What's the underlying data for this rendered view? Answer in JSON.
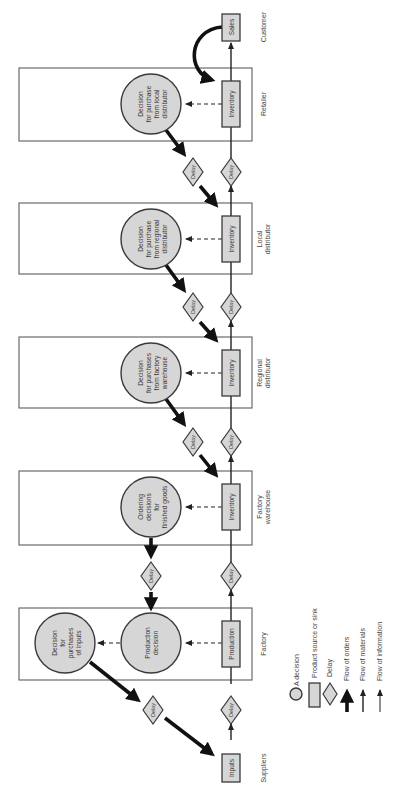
{
  "diagram": {
    "orientation": "rotated 90 degrees counter-clockwise",
    "stages": [
      {
        "id": "customer",
        "label": "Customer"
      },
      {
        "id": "retailer",
        "label": "Retailer"
      },
      {
        "id": "local",
        "label_lines": [
          "Local",
          "distributor"
        ]
      },
      {
        "id": "regional",
        "label_lines": [
          "Regional",
          "distributor"
        ]
      },
      {
        "id": "warehouse",
        "label_lines": [
          "Factory",
          "warehouse"
        ]
      },
      {
        "id": "factory",
        "label": "Factory"
      },
      {
        "id": "suppliers",
        "label": "Suppliers"
      }
    ],
    "nodes": {
      "sales": "Sales",
      "inventory": "Inventory",
      "production": "Production",
      "inputs": "Inputs",
      "delay": "Delay",
      "retailer_decision": [
        "Decision",
        "for purchase",
        "from local",
        "distributor"
      ],
      "local_decision": [
        "Decision",
        "for purchase",
        "from regional",
        "distributor"
      ],
      "regional_decision": [
        "Decision",
        "for purchases",
        "from factory",
        "warehouse"
      ],
      "warehouse_decision": [
        "Ordering",
        "decisions",
        "for",
        "finished goods"
      ],
      "production_decision": [
        "Production",
        "decision"
      ],
      "inputs_decision": [
        "Decision",
        "for",
        "purchases",
        "of inputs"
      ]
    },
    "legend": {
      "decision": "A decision",
      "source_sink": "Product source or sink",
      "delay": "Delay",
      "orders": "Flow of orders",
      "materials": "Flow of materials",
      "information": "Flow of information"
    },
    "colors": {
      "shape_fill": "#d6d6d6",
      "stroke": "#3a3a3a",
      "order_flow": "#111111",
      "frame": "#6a6a6a"
    }
  }
}
